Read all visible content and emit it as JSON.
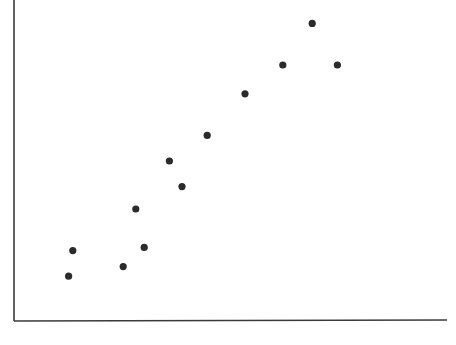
{
  "chart_data": {
    "type": "scatter",
    "title": "",
    "xlabel": "",
    "ylabel": "",
    "grid": false,
    "legend": null,
    "xlim": [
      0,
      10
    ],
    "ylim": [
      0,
      10
    ],
    "points": [
      {
        "x": 1.3,
        "y": 1.4
      },
      {
        "x": 1.4,
        "y": 2.2
      },
      {
        "x": 2.6,
        "y": 1.7
      },
      {
        "x": 2.9,
        "y": 3.5
      },
      {
        "x": 3.1,
        "y": 2.3
      },
      {
        "x": 3.7,
        "y": 5.0
      },
      {
        "x": 4.0,
        "y": 4.2
      },
      {
        "x": 4.6,
        "y": 5.8
      },
      {
        "x": 5.5,
        "y": 7.1
      },
      {
        "x": 6.4,
        "y": 8.0
      },
      {
        "x": 7.1,
        "y": 9.3
      },
      {
        "x": 7.7,
        "y": 8.0
      }
    ],
    "marker_color": "#2b2b2b",
    "axis_color": "#3a3a3a"
  },
  "layout": {
    "origin_px": [
      14,
      321
    ],
    "x_axis_end_px": 447,
    "y_axis_top_px": 0,
    "px_per_unit_x": 42.0,
    "px_per_unit_y": 32.0
  }
}
